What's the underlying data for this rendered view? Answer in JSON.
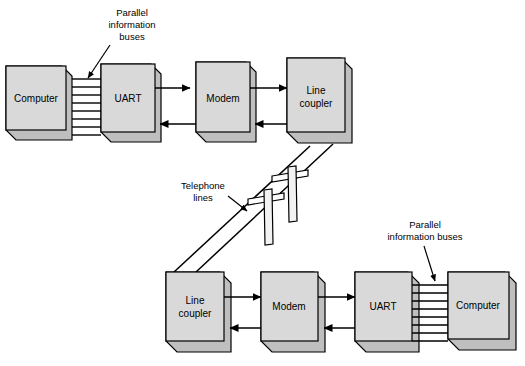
{
  "diagram": {
    "colors": {
      "box_face": "#d9d9d9",
      "box_top": "#f2f2f2",
      "box_side": "#bfbfbf",
      "stroke": "#000000",
      "background": "#ffffff"
    },
    "top_chain": {
      "boxes": [
        {
          "id": "computer-top",
          "label": "Computer",
          "label_lines": [
            "Computer"
          ]
        },
        {
          "id": "uart-top",
          "label": "UART",
          "label_lines": [
            "UART"
          ]
        },
        {
          "id": "modem-top",
          "label": "Modem",
          "label_lines": [
            "Modem"
          ]
        },
        {
          "id": "line-coupler-top",
          "label": "Line coupler",
          "label_lines": [
            "Line",
            "coupler"
          ]
        }
      ],
      "bus": {
        "id": "bus-top",
        "line_count": 8
      },
      "arrows": [
        {
          "id": "uart-to-modem-top",
          "direction": "right"
        },
        {
          "id": "modem-to-uart-top",
          "direction": "left"
        },
        {
          "id": "modem-to-coupler-top",
          "direction": "right"
        },
        {
          "id": "coupler-to-modem-top",
          "direction": "left"
        }
      ]
    },
    "bottom_chain": {
      "boxes": [
        {
          "id": "line-coupler-bottom",
          "label": "Line coupler",
          "label_lines": [
            "Line",
            "coupler"
          ]
        },
        {
          "id": "modem-bottom",
          "label": "Modem",
          "label_lines": [
            "Modem"
          ]
        },
        {
          "id": "uart-bottom",
          "label": "UART",
          "label_lines": [
            "UART"
          ]
        },
        {
          "id": "computer-bottom",
          "label": "Computer",
          "label_lines": [
            "Computer"
          ]
        }
      ],
      "bus": {
        "id": "bus-bottom",
        "line_count": 8
      },
      "arrows": [
        {
          "id": "coupler-to-modem-bottom",
          "direction": "right"
        },
        {
          "id": "modem-to-coupler-bottom",
          "direction": "left"
        },
        {
          "id": "modem-to-uart-bottom",
          "direction": "right"
        },
        {
          "id": "uart-to-modem-bottom",
          "direction": "left"
        }
      ]
    },
    "annotations": {
      "parallel_top": {
        "id": "parallel-buses-top",
        "lines": [
          "Parallel",
          "information",
          "buses"
        ]
      },
      "parallel_bottom": {
        "id": "parallel-buses-bottom",
        "lines": [
          "Parallel",
          "information buses"
        ]
      },
      "telephone": {
        "id": "telephone-lines",
        "lines": [
          "Telephone",
          "lines"
        ]
      }
    },
    "telephone_poles": [
      {
        "id": "pole-upper"
      },
      {
        "id": "pole-lower"
      }
    ]
  }
}
